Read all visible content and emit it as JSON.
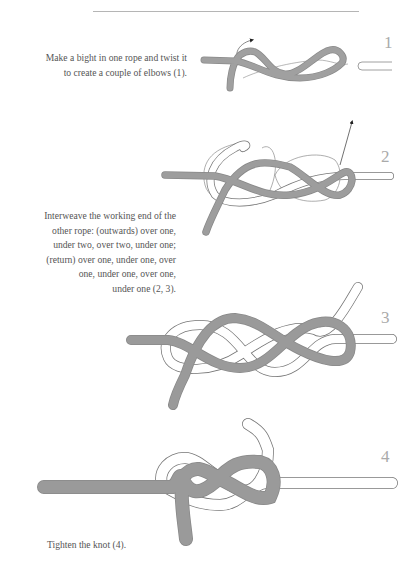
{
  "page": {
    "colors": {
      "rope_dark": "#9a9a9a",
      "rope_light": "#ffffff",
      "outline": "#7a7a7a",
      "text": "#555555",
      "step_number": "#aaaaaa",
      "rule": "#b5b5b5"
    }
  },
  "captions": [
    {
      "lines": [
        "Make a bight in one rope and twist it",
        "to create a couple of elbows (1)."
      ]
    },
    {
      "lines": [
        "Interweave the working end of the",
        "other rope: (outwards) over one,",
        "under two, over two, under one;",
        "(return) over one, under one, over",
        "one, under one, over one,",
        "under one (2, 3)."
      ]
    },
    {
      "lines": [
        "Tighten the knot (4)."
      ]
    }
  ],
  "steps": [
    {
      "number": "1"
    },
    {
      "number": "2"
    },
    {
      "number": "3"
    },
    {
      "number": "4"
    }
  ]
}
